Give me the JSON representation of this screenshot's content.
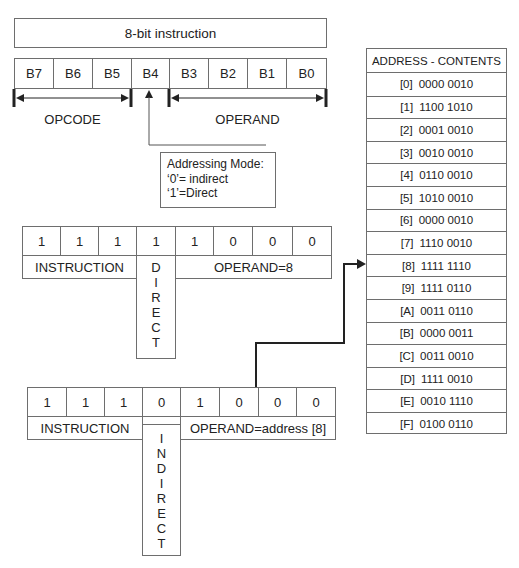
{
  "format_diagram": {
    "title": "8-bit instruction",
    "bits": [
      "B7",
      "B6",
      "B5",
      "B4",
      "B3",
      "B2",
      "B1",
      "B0"
    ],
    "opcode_label": "OPCODE",
    "operand_label": "OPERAND",
    "addressing_mode": {
      "line1": "Addressing Mode:",
      "line2": "‘0’= indirect",
      "line3": "‘1’=Direct"
    }
  },
  "direct_example": {
    "bits": [
      "1",
      "1",
      "1",
      "1",
      "1",
      "0",
      "0",
      "0"
    ],
    "instruction_label": "INSTRUCTION",
    "mode_letters": [
      "D",
      "I",
      "R",
      "E",
      "C",
      "T"
    ],
    "operand_label": "OPERAND=8"
  },
  "indirect_example": {
    "bits": [
      "1",
      "1",
      "1",
      "0",
      "1",
      "0",
      "0",
      "0"
    ],
    "instruction_label": "INSTRUCTION",
    "mode_letters": [
      "I",
      "N",
      "D",
      "I",
      "R",
      "E",
      "C",
      "T"
    ],
    "operand_label": "OPERAND=address [8]"
  },
  "memory_table": {
    "header": "ADDRESS - CONTENTS",
    "rows": [
      {
        "address": "[0]",
        "contents": "0000 0010"
      },
      {
        "address": "[1]",
        "contents": "1100 1010"
      },
      {
        "address": "[2]",
        "contents": "0001 0010"
      },
      {
        "address": "[3]",
        "contents": "0010 0010"
      },
      {
        "address": "[4]",
        "contents": "0110 0010"
      },
      {
        "address": "[5]",
        "contents": "1010 0010"
      },
      {
        "address": "[6]",
        "contents": "0000 0010"
      },
      {
        "address": "[7]",
        "contents": "1110 0010"
      },
      {
        "address": "[8]",
        "contents": "1111 1110"
      },
      {
        "address": "[9]",
        "contents": "1111 0110"
      },
      {
        "address": "[A]",
        "contents": "0011 0110"
      },
      {
        "address": "[B]",
        "contents": "0000 0011"
      },
      {
        "address": "[C]",
        "contents": "0011 0010"
      },
      {
        "address": "[D]",
        "contents": "1111 0010"
      },
      {
        "address": "[E]",
        "contents": "0010 1110"
      },
      {
        "address": "[F]",
        "contents": "0100 0110"
      }
    ]
  }
}
